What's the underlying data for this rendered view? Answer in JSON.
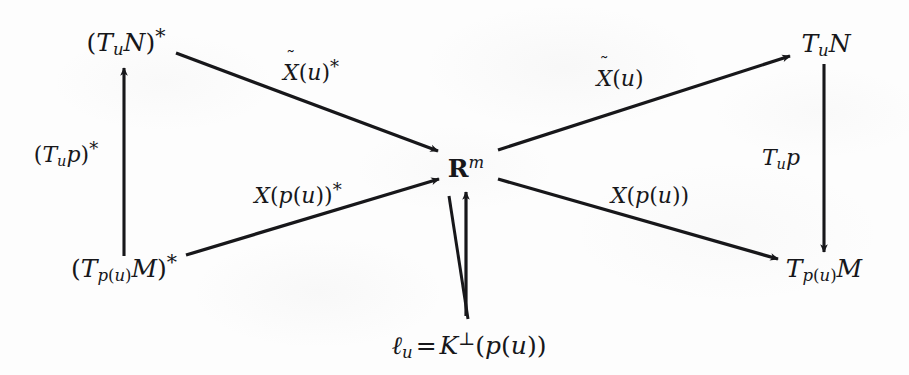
{
  "diagram": {
    "kind": "commutative-diagram",
    "background_color": "#fdfdfd",
    "ink_color": "#17171a",
    "nodes": [
      {
        "id": "top-left",
        "label": "(T_u N)*",
        "x": 126,
        "y": 42
      },
      {
        "id": "bottom-left",
        "label": "(T_p(u) M)*",
        "x": 122,
        "y": 268
      },
      {
        "id": "center",
        "label": "R^m",
        "x": 466,
        "y": 168
      },
      {
        "id": "top-right",
        "label": "T_u N",
        "x": 826,
        "y": 43
      },
      {
        "id": "bottom-right",
        "label": "T_p(u) M",
        "x": 824,
        "y": 268
      },
      {
        "id": "bottom-center",
        "label": "l_u = K^perp(p(u))",
        "x": 469,
        "y": 345
      }
    ],
    "edge_labels": [
      {
        "id": "upper-left-edge",
        "label": "X~(u)*",
        "x": 311,
        "y": 73
      },
      {
        "id": "lower-left-edge",
        "label": "X(p(u))*",
        "x": 298,
        "y": 196
      },
      {
        "id": "upper-right-edge",
        "label": "X~(u)",
        "x": 620,
        "y": 79
      },
      {
        "id": "lower-right-edge",
        "label": "X(p(u))",
        "x": 650,
        "y": 196
      },
      {
        "id": "left-vertical-edge",
        "label": "(T_u p)*",
        "x": 66,
        "y": 155
      },
      {
        "id": "right-vertical-edge",
        "label": "T_u p",
        "x": 781,
        "y": 158
      }
    ],
    "arrows": [
      {
        "id": "arrow-left-vertical",
        "from": "bottom-left",
        "to": "top-left",
        "x1": 124,
        "y1": 256,
        "x2": 124,
        "y2": 66
      },
      {
        "id": "arrow-topleft-center",
        "from": "top-left",
        "to": "center",
        "x1": 176,
        "y1": 53,
        "x2": 440,
        "y2": 152
      },
      {
        "id": "arrow-bottomleft-center",
        "from": "bottom-left",
        "to": "center",
        "x1": 186,
        "y1": 255,
        "x2": 441,
        "y2": 178
      },
      {
        "id": "arrow-center-topright",
        "from": "center",
        "to": "top-right",
        "x1": 500,
        "y1": 151,
        "x2": 790,
        "y2": 56
      },
      {
        "id": "arrow-center-bottomright",
        "from": "center",
        "to": "bottom-right",
        "x1": 500,
        "y1": 178,
        "x2": 777,
        "y2": 258
      },
      {
        "id": "arrow-right-vertical",
        "from": "top-right",
        "to": "bottom-right",
        "x1": 824,
        "y1": 64,
        "x2": 824,
        "y2": 250
      },
      {
        "id": "arrow-bottomcenter-center",
        "from": "bottom-center",
        "to": "center",
        "x1": 466,
        "y1": 315,
        "x2": 466,
        "y2": 192
      },
      {
        "id": "line-bottomcenter-slant",
        "from": "bottom-center",
        "to": "center",
        "x1": 468,
        "y1": 318,
        "x2": 450,
        "y2": 195
      }
    ]
  }
}
